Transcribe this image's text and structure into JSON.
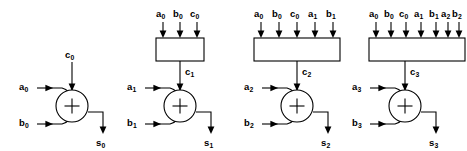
{
  "figure": {
    "background_color": "#ffffff",
    "line_color": "#000000",
    "width": 467,
    "height": 151
  },
  "cells": [
    {
      "index": 0,
      "has_carry_box": false,
      "box_inputs": [],
      "carry_in_label": "c",
      "carry_in_sub": "0",
      "operand_a_label": "a",
      "operand_a_sub": "0",
      "operand_b_label": "b",
      "operand_b_sub": "0",
      "sum_label": "s",
      "sum_sub": "0",
      "adder_symbol": "+"
    },
    {
      "index": 1,
      "has_carry_box": true,
      "box_inputs": [
        {
          "label": "a",
          "sub": "0"
        },
        {
          "label": "b",
          "sub": "0"
        },
        {
          "label": "c",
          "sub": "0"
        }
      ],
      "carry_in_label": "c",
      "carry_in_sub": "1",
      "operand_a_label": "a",
      "operand_a_sub": "1",
      "operand_b_label": "b",
      "operand_b_sub": "1",
      "sum_label": "s",
      "sum_sub": "1",
      "adder_symbol": "+"
    },
    {
      "index": 2,
      "has_carry_box": true,
      "box_inputs": [
        {
          "label": "a",
          "sub": "0"
        },
        {
          "label": "b",
          "sub": "0"
        },
        {
          "label": "c",
          "sub": "0"
        },
        {
          "label": "a",
          "sub": "1"
        },
        {
          "label": "b",
          "sub": "1"
        }
      ],
      "carry_in_label": "c",
      "carry_in_sub": "2",
      "operand_a_label": "a",
      "operand_a_sub": "2",
      "operand_b_label": "b",
      "operand_b_sub": "2",
      "sum_label": "s",
      "sum_sub": "2",
      "adder_symbol": "+"
    },
    {
      "index": 3,
      "has_carry_box": true,
      "box_inputs": [
        {
          "label": "a",
          "sub": "0"
        },
        {
          "label": "b",
          "sub": "0"
        },
        {
          "label": "c",
          "sub": "0"
        },
        {
          "label": "a",
          "sub": "1"
        },
        {
          "label": "b",
          "sub": "1"
        },
        {
          "label": "a",
          "sub": "2"
        },
        {
          "label": "b",
          "sub": "2"
        }
      ],
      "carry_in_label": "c",
      "carry_in_sub": "3",
      "operand_a_label": "a",
      "operand_a_sub": "3",
      "operand_b_label": "b",
      "operand_b_sub": "3",
      "sum_label": "s",
      "sum_sub": "3",
      "adder_symbol": "+"
    }
  ]
}
